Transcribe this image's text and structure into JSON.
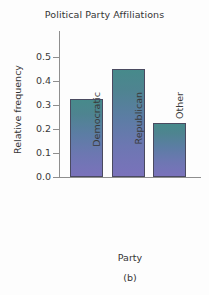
{
  "chart_data": {
    "type": "bar",
    "title": "Political Party Affiliations",
    "xlabel": "Party",
    "ylabel": "Relative frequency",
    "categories": [
      "Democratic",
      "Republican",
      "Other"
    ],
    "values": [
      0.325,
      0.45,
      0.225
    ],
    "ylim": [
      0.0,
      0.55
    ],
    "yticks": [
      0.0,
      0.1,
      0.2,
      0.3,
      0.4,
      0.5
    ],
    "ytick_labels": [
      "0.0",
      "0.1",
      "0.2",
      "0.3",
      "0.4",
      "0.5"
    ],
    "grid": false,
    "legend": false,
    "bar_fill_top_color": "#478a8b",
    "bar_fill_bottom_color": "#7a72bb",
    "bar_edge_color": "#4a4a60",
    "axis_color": "#8e8e8e",
    "background_color": "#fdfdfd"
  },
  "caption": "(b)"
}
